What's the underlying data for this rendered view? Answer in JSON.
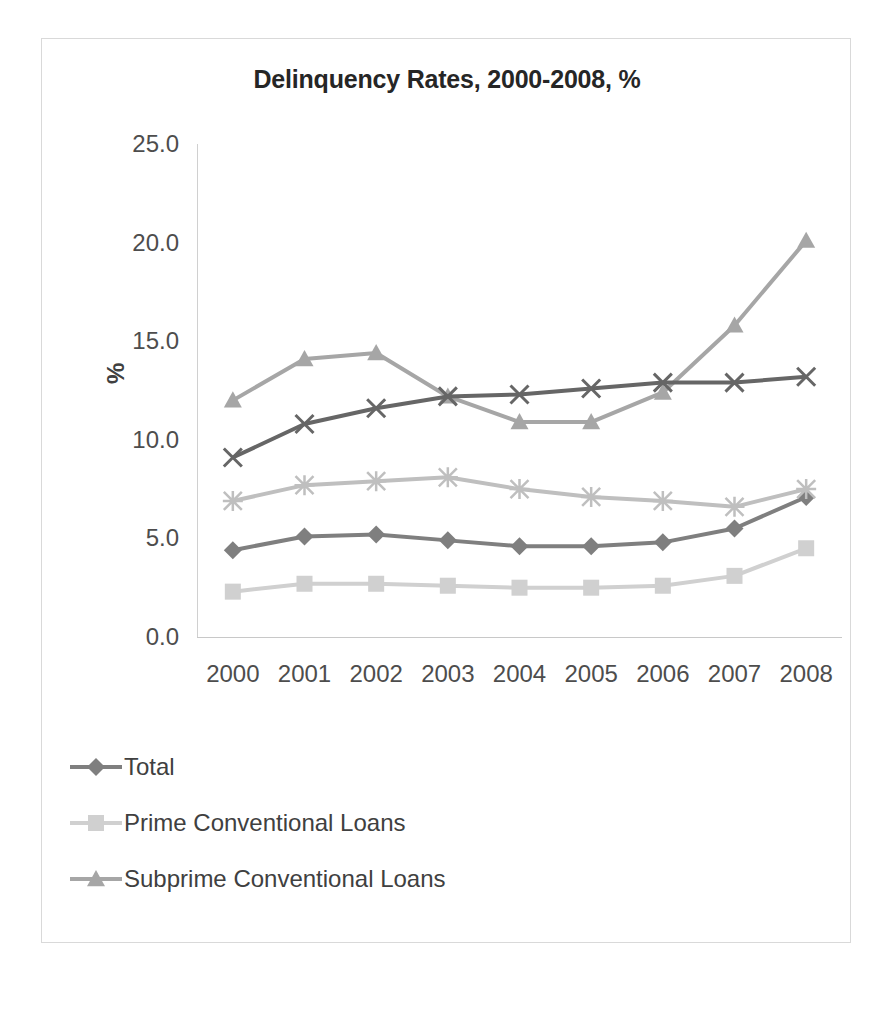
{
  "chart_data": {
    "type": "line",
    "title": "Delinquency Rates, 2000-2008, %",
    "xlabel": "",
    "ylabel": "%",
    "categories": [
      "2000",
      "2001",
      "2002",
      "2003",
      "2004",
      "2005",
      "2006",
      "2007",
      "2008"
    ],
    "x": [
      2000,
      2001,
      2002,
      2003,
      2004,
      2005,
      2006,
      2007,
      2008
    ],
    "ylim": [
      0.0,
      25.0
    ],
    "yticks": [
      "0.0",
      "5.0",
      "10.0",
      "15.0",
      "20.0",
      "25.0"
    ],
    "ytick_values": [
      0.0,
      5.0,
      10.0,
      15.0,
      20.0,
      25.0
    ],
    "grid": false,
    "legend_position": "bottom-left",
    "series": [
      {
        "name": "Total",
        "marker": "diamond",
        "color": "#7f7f7f",
        "in_legend": true,
        "values": [
          4.4,
          5.1,
          5.2,
          4.9,
          4.6,
          4.6,
          4.8,
          5.5,
          7.1
        ]
      },
      {
        "name": "Prime Conventional Loans",
        "marker": "square",
        "color": "#d0d0d0",
        "in_legend": true,
        "values": [
          2.3,
          2.7,
          2.7,
          2.6,
          2.5,
          2.5,
          2.6,
          3.1,
          4.5
        ]
      },
      {
        "name": "Subprime Conventional Loans",
        "marker": "triangle",
        "color": "#a6a6a6",
        "in_legend": true,
        "values": [
          12.0,
          14.1,
          14.4,
          12.2,
          10.9,
          10.9,
          12.4,
          15.8,
          20.1
        ]
      },
      {
        "name": "",
        "marker": "x",
        "color": "#666666",
        "in_legend": false,
        "values": [
          9.1,
          10.8,
          11.6,
          12.2,
          12.3,
          12.6,
          12.9,
          12.9,
          13.2
        ]
      },
      {
        "name": "",
        "marker": "asterisk",
        "color": "#bfbfbf",
        "in_legend": false,
        "values": [
          6.9,
          7.7,
          7.9,
          8.1,
          7.5,
          7.1,
          6.9,
          6.6,
          7.5
        ]
      }
    ]
  },
  "colors": {
    "background": "#ffffff",
    "border": "#d9d9d9",
    "axis": "#d0d0d0",
    "text": "#404040",
    "title": "#262626"
  }
}
